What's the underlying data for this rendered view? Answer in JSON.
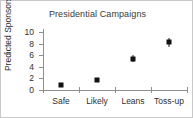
{
  "chart_data": {
    "type": "scatter",
    "title": "Presidential Campaigns",
    "xlabel": "",
    "ylabel": "Predicted Sponsors",
    "categories": [
      "Safe",
      "Likely",
      "Leans",
      "Toss-up"
    ],
    "values": [
      0.8,
      1.7,
      5.4,
      8.3
    ],
    "error_low": [
      0.75,
      1.35,
      4.8,
      7.5
    ],
    "error_high": [
      0.9,
      2.1,
      6.0,
      9.1
    ],
    "ylim": [
      0,
      10.6
    ],
    "yticks": [
      0,
      2,
      4,
      6,
      8,
      10
    ],
    "ytick_labels": [
      "0",
      "2",
      "4",
      "6",
      "8",
      "10"
    ],
    "grid": false,
    "legend": "none",
    "marker": "square",
    "marker_color": "#111111",
    "axis_color": "#8f8f8f",
    "border_color": "#c9c9c9"
  }
}
